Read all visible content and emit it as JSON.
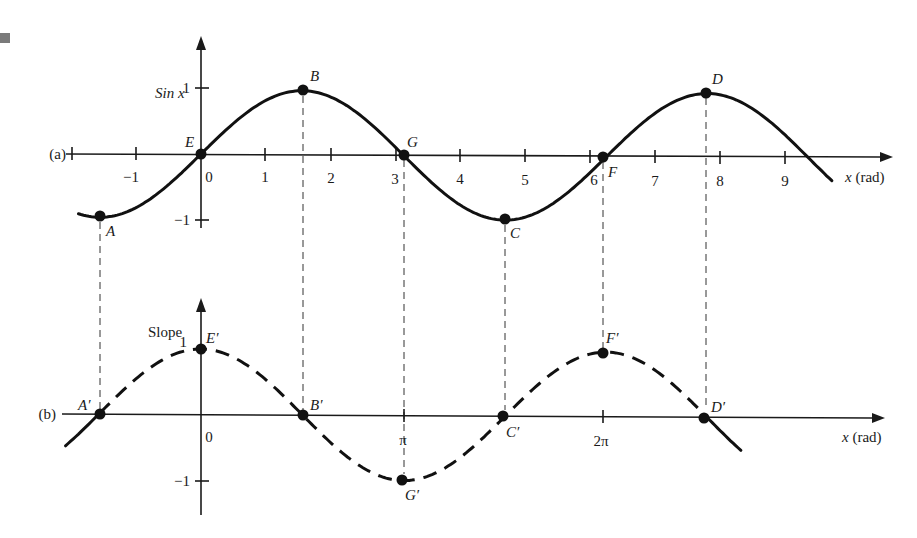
{
  "chart_data": [
    {
      "panel": "(a)",
      "type": "line",
      "title": "",
      "ylabel": "Sin x",
      "xlabel": "x (rad)",
      "function": "sin(x)",
      "line_style": "solid",
      "xlim": [
        -1.9,
        10.2
      ],
      "ylim": [
        -1.2,
        1.4
      ],
      "grid": false,
      "x_ticks": [
        "-1",
        "0",
        "1",
        "2",
        "3",
        "4",
        "5",
        "6",
        "7",
        "8",
        "9"
      ],
      "y_ticks": [
        "1",
        "-1"
      ],
      "points": [
        {
          "label": "A",
          "x": -1.571,
          "y": -1
        },
        {
          "label": "E",
          "x": 0,
          "y": 0
        },
        {
          "label": "B",
          "x": 1.571,
          "y": 1
        },
        {
          "label": "G",
          "x": 3.142,
          "y": 0
        },
        {
          "label": "C",
          "x": 4.712,
          "y": -1
        },
        {
          "label": "F",
          "x": 6.283,
          "y": 0
        },
        {
          "label": "D",
          "x": 7.854,
          "y": 1
        }
      ],
      "curve_x_range": [
        -1.9,
        9.8
      ]
    },
    {
      "panel": "(b)",
      "type": "line",
      "title": "",
      "ylabel": "Slope",
      "xlabel": "x (rad)",
      "function": "cos(x)",
      "line_style": "dashed",
      "xlim": [
        -1.9,
        10.2
      ],
      "ylim": [
        -1.4,
        1.6
      ],
      "grid": false,
      "x_ticks": [
        "0",
        "π",
        "2π"
      ],
      "y_ticks": [
        "1",
        "-1"
      ],
      "points": [
        {
          "label": "A′",
          "x": -1.571,
          "y": 0
        },
        {
          "label": "E′",
          "x": 0,
          "y": 1
        },
        {
          "label": "B′",
          "x": 1.571,
          "y": 0
        },
        {
          "label": "G′",
          "x": 3.142,
          "y": -1
        },
        {
          "label": "C′",
          "x": 4.712,
          "y": 0
        },
        {
          "label": "F′",
          "x": 6.283,
          "y": 1
        },
        {
          "label": "D′",
          "x": 7.854,
          "y": 0
        }
      ],
      "curve_x_range": [
        -2.1,
        8.4
      ]
    }
  ],
  "labels": {
    "panel_a": "(a)",
    "panel_b": "(b)",
    "a_ylabel": "Sin x",
    "b_ylabel": "Slope",
    "xlabel": "x (rad)",
    "a_x_ticks": [
      "−1",
      "0",
      "1",
      "2",
      "3",
      "4",
      "5",
      "6",
      "7",
      "8",
      "9"
    ],
    "a_y_ticks": [
      "1",
      "−1"
    ],
    "b_x_ticks": [
      "0",
      "π",
      "2π"
    ],
    "b_y_ticks": [
      "1",
      "−1"
    ],
    "a_points": [
      "A",
      "E",
      "B",
      "G",
      "C",
      "F",
      "D"
    ],
    "b_points": [
      "A′",
      "E′",
      "B′",
      "G′",
      "C′",
      "F′",
      "D′"
    ]
  }
}
